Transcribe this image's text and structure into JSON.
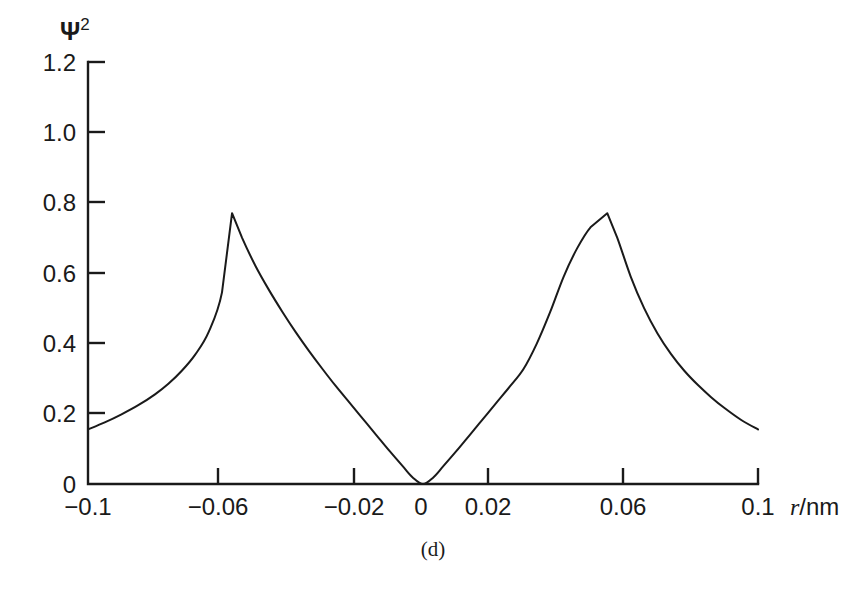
{
  "figure": {
    "caption": "(d)",
    "background_color": "#ffffff",
    "line_color": "#1a1a1a"
  },
  "chart_data": {
    "type": "line",
    "title": "",
    "subtitle": "",
    "xlabel": "r/nm",
    "xlabel_symbol": "r",
    "xlabel_unit": "/nm",
    "ylabel": "Ψ²",
    "ylabel_symbol": "Ψ",
    "ylabel_exponent": "2",
    "xlim": [
      -0.1,
      0.1
    ],
    "ylim": [
      0,
      1.2
    ],
    "grid": false,
    "legend": "none",
    "xticks": [
      -0.1,
      -0.06,
      -0.02,
      0,
      0.02,
      0.06,
      0.1
    ],
    "xticklabels": [
      "−0.1",
      "−0.06",
      "−0.02",
      "0",
      "0.02",
      "0.06",
      "0.1"
    ],
    "yticks": [
      0,
      0.2,
      0.4,
      0.6,
      0.8,
      1.0,
      1.2
    ],
    "yticklabels": [
      "0",
      "0.2",
      "0.4",
      "0.6",
      "0.8",
      "1.0",
      "1.2"
    ],
    "annotations": [
      {
        "text": "peak-left",
        "x": -0.057,
        "y": 0.77
      },
      {
        "text": "node-center",
        "x": 0.0,
        "y": 0.0
      },
      {
        "text": "peak-right",
        "x": 0.055,
        "y": 0.77
      }
    ],
    "series": [
      {
        "name": "Ψ²",
        "x": [
          -0.1,
          -0.095,
          -0.09,
          -0.085,
          -0.08,
          -0.076,
          -0.072,
          -0.068,
          -0.064,
          -0.06,
          -0.057,
          -0.054,
          -0.05,
          -0.046,
          -0.042,
          -0.038,
          -0.034,
          -0.03,
          -0.026,
          -0.022,
          -0.018,
          -0.014,
          -0.01,
          -0.006,
          -0.003,
          0.0,
          0.003,
          0.006,
          0.01,
          0.014,
          0.018,
          0.022,
          0.026,
          0.03,
          0.034,
          0.038,
          0.042,
          0.046,
          0.05,
          0.055,
          0.058,
          0.062,
          0.066,
          0.07,
          0.074,
          0.078,
          0.082,
          0.086,
          0.09,
          0.095,
          0.1
        ],
        "y": [
          0.155,
          0.175,
          0.198,
          0.224,
          0.255,
          0.285,
          0.322,
          0.368,
          0.432,
          0.545,
          0.77,
          0.7,
          0.62,
          0.552,
          0.49,
          0.432,
          0.378,
          0.327,
          0.278,
          0.232,
          0.186,
          0.14,
          0.094,
          0.05,
          0.018,
          0.0,
          0.018,
          0.05,
          0.094,
          0.14,
          0.186,
          0.232,
          0.278,
          0.327,
          0.4,
          0.49,
          0.59,
          0.67,
          0.73,
          0.77,
          0.7,
          0.59,
          0.5,
          0.428,
          0.37,
          0.322,
          0.282,
          0.247,
          0.216,
          0.182,
          0.155
        ]
      }
    ]
  }
}
